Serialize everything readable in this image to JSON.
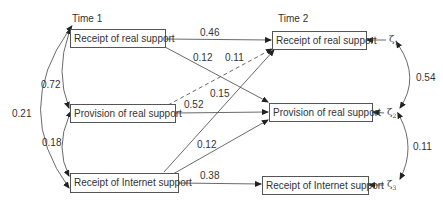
{
  "diagram": {
    "type": "path-model",
    "time_labels": {
      "t1": "Time 1",
      "t2": "Time 2"
    },
    "nodes": {
      "t1_receipt_real": "Receipt of real support",
      "t1_provision_real": "Provision of real support",
      "t1_receipt_internet": "Receipt of Internet support",
      "t2_receipt_real": "Receipt of real support",
      "t2_provision_real": "Provision of real support",
      "t2_receipt_internet": "Receipt of Internet support"
    },
    "disturbances": {
      "z1": {
        "symbol": "ζ",
        "sub": "1"
      },
      "z2": {
        "symbol": "ζ",
        "sub": "2"
      },
      "z3": {
        "symbol": "ζ",
        "sub": "3"
      }
    },
    "paths": [
      {
        "from": "t1_receipt_real",
        "to": "t2_receipt_real",
        "coef": "0.46",
        "style": "solid"
      },
      {
        "from": "t1_receipt_real",
        "to": "t2_provision_real",
        "coef": "0.12",
        "style": "solid"
      },
      {
        "from": "t1_provision_real",
        "to": "t2_receipt_real",
        "coef": "0.11",
        "style": "dashed"
      },
      {
        "from": "t1_provision_real",
        "to": "t2_provision_real",
        "coef": "0.52",
        "style": "solid"
      },
      {
        "from": "t1_receipt_internet",
        "to": "t2_receipt_real",
        "coef": "0.15",
        "style": "solid"
      },
      {
        "from": "t1_receipt_internet",
        "to": "t2_provision_real",
        "coef": "0.12",
        "style": "solid"
      },
      {
        "from": "t1_receipt_internet",
        "to": "t2_receipt_internet",
        "coef": "0.38",
        "style": "solid"
      }
    ],
    "correlations": [
      {
        "between": [
          "t1_receipt_real",
          "t1_provision_real"
        ],
        "coef": "0.72"
      },
      {
        "between": [
          "t1_provision_real",
          "t1_receipt_internet"
        ],
        "coef": "0.18"
      },
      {
        "between": [
          "t1_receipt_real",
          "t1_receipt_internet"
        ],
        "coef": "0.21"
      },
      {
        "between": [
          "z1",
          "z2"
        ],
        "coef": "0.54"
      },
      {
        "between": [
          "z2",
          "z3"
        ],
        "coef": "0.11"
      }
    ]
  }
}
